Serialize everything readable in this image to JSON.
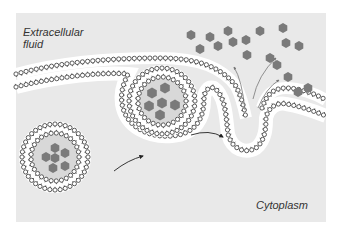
{
  "diagram": {
    "labels": {
      "extracellular": "Extracellular\nfluid",
      "cytoplasm": "Cytoplasm"
    },
    "colors": {
      "panel": "#e9e9e9",
      "membrane_fill": "#ffffff",
      "head_stroke": "#333333",
      "cargo": "#7a7a7a",
      "arrow": "#222222",
      "release_arrow": "#777777",
      "vesicle_lumen": "#d8d8d8"
    },
    "stages": [
      {
        "name": "secretory-vesicle",
        "description": "Vesicle with cargo approaching membrane"
      },
      {
        "name": "fusing-vesicle",
        "description": "Vesicle docking and fusing with plasma membrane"
      },
      {
        "name": "release",
        "description": "Cargo released into extracellular fluid"
      }
    ],
    "free_vesicle": {
      "cx": 55,
      "cy": 157,
      "r_outer": 35,
      "r_inner": 24
    },
    "docked_vesicle": {
      "cx": 162,
      "cy": 101,
      "r_outer": 35,
      "r_inner": 24
    },
    "cargo_free": [
      [
        55,
        148
      ],
      [
        46,
        157
      ],
      [
        55,
        158
      ],
      [
        65,
        153
      ],
      [
        53,
        168
      ],
      [
        65,
        166
      ]
    ],
    "cargo_docked": [
      [
        152,
        93
      ],
      [
        165,
        88
      ],
      [
        149,
        106
      ],
      [
        162,
        103
      ],
      [
        175,
        105
      ],
      [
        160,
        115
      ]
    ],
    "released_cargo": [
      [
        191,
        35
      ],
      [
        210,
        37
      ],
      [
        228,
        31
      ],
      [
        200,
        49
      ],
      [
        218,
        46
      ],
      [
        233,
        42
      ],
      [
        246,
        40
      ],
      [
        260,
        31
      ],
      [
        283,
        28
      ],
      [
        247,
        55
      ],
      [
        270,
        58
      ],
      [
        286,
        43
      ],
      [
        299,
        46
      ],
      [
        277,
        65
      ],
      [
        288,
        77
      ],
      [
        298,
        92
      ],
      [
        308,
        88
      ]
    ],
    "arrows": [
      {
        "from": [
          114,
          171
        ],
        "ctrl": [
          128,
          160
        ],
        "to": [
          143,
          156
        ]
      },
      {
        "from": [
          191,
          135
        ],
        "ctrl": [
          209,
          129
        ],
        "to": [
          223,
          137
        ]
      }
    ],
    "release_arrows": [
      {
        "from": [
          245,
          110
        ],
        "ctrl": [
          242,
          80
        ],
        "to": [
          234,
          67
        ]
      },
      {
        "from": [
          253,
          99
        ],
        "ctrl": [
          258,
          75
        ],
        "to": [
          276,
          58
        ]
      },
      {
        "from": [
          258,
          108
        ],
        "ctrl": [
          266,
          88
        ],
        "to": [
          279,
          80
        ]
      }
    ]
  }
}
